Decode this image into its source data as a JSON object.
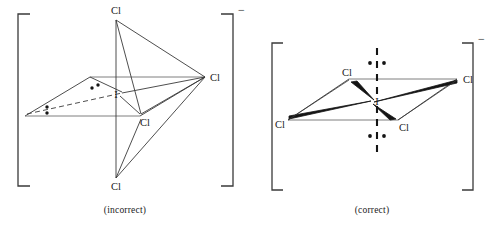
{
  "figure": {
    "ion_charge": "−",
    "panels": [
      {
        "id": "incorrect",
        "caption": "(incorrect)",
        "central_atom": "I",
        "geometry": "distorted octahedral / see-saw drawing with four Cl and two lone pairs",
        "ligand_labels": [
          "Cl",
          "Cl",
          "Cl",
          "Cl"
        ],
        "lone_pair_count": 2,
        "bracket_charge": "−"
      },
      {
        "id": "correct",
        "caption": "(correct)",
        "central_atom": "I",
        "geometry": "square planar with axial lone pairs above and below",
        "ligand_labels": [
          "Cl",
          "Cl",
          "Cl",
          "Cl"
        ],
        "lone_pair_count": 2,
        "bracket_charge": "−"
      }
    ]
  },
  "incorrect": {
    "caption": "(incorrect)",
    "charge": "−",
    "atoms": {
      "center": "I",
      "top": "Cl",
      "right": "Cl",
      "bottom": "Cl",
      "front": "Cl"
    }
  },
  "correct": {
    "caption": "(correct)",
    "charge": "−",
    "atoms": {
      "center": "I",
      "back_left": "Cl",
      "right": "Cl",
      "left": "Cl",
      "front": "Cl"
    }
  },
  "colors": {
    "stroke": "#3a3a3a",
    "bold_stroke": "#141414",
    "text": "#1a1a1a",
    "background": "#ffffff"
  }
}
